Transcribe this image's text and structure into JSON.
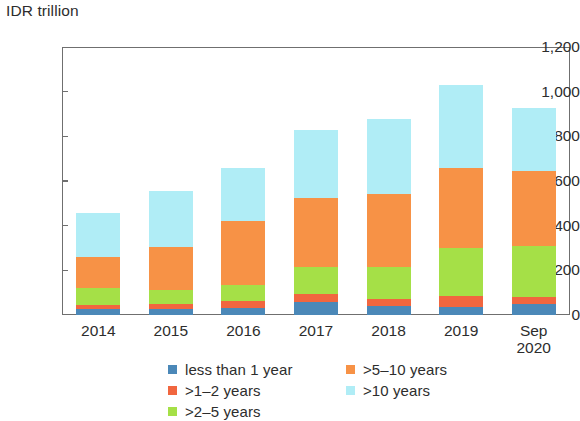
{
  "chart_data": {
    "type": "bar",
    "stacked": true,
    "title": "",
    "subtitle": "",
    "ylabel": "IDR trillion",
    "xlabel": "",
    "ylim": [
      0,
      1200
    ],
    "yticks": [
      0,
      200,
      400,
      600,
      800,
      1000,
      1200
    ],
    "ytick_labels": [
      "0",
      "200",
      "400",
      "600",
      "800",
      "1,000",
      "1,200"
    ],
    "grid": false,
    "legend_position": "bottom",
    "categories": [
      "2014",
      "2015",
      "2016",
      "2017",
      "2018",
      "2019",
      "Sep\n2020"
    ],
    "series": [
      {
        "name": "less than 1 year",
        "color": "#4b88b8",
        "values": [
          25,
          25,
          30,
          60,
          40,
          35,
          50
        ]
      },
      {
        "name": ">1–2 years",
        "color": "#f1663f",
        "values": [
          20,
          25,
          35,
          35,
          30,
          50,
          30
        ]
      },
      {
        "name": ">2–5 years",
        "color": "#a5e047",
        "values": [
          75,
          60,
          70,
          120,
          145,
          215,
          230
        ]
      },
      {
        "name": ">5–10 years",
        "color": "#f79246",
        "values": [
          140,
          195,
          285,
          310,
          325,
          360,
          335
        ]
      },
      {
        "name": ">10 years",
        "color": "#b0edf6",
        "values": [
          195,
          250,
          240,
          305,
          340,
          370,
          280
        ]
      }
    ],
    "totals": [
      455,
      555,
      660,
      830,
      880,
      1030,
      925
    ]
  },
  "legend": {
    "columns": [
      [
        "less than 1 year",
        ">1–2 years",
        ">2–5 years"
      ],
      [
        ">5–10 years",
        ">10 years"
      ]
    ]
  },
  "colors": {
    "axis": "#6f6f6f",
    "text": "#2d2d2d",
    "background": "#ffffff"
  }
}
